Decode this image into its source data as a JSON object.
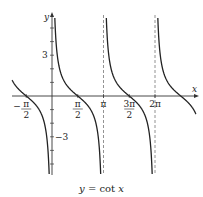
{
  "chart_data": {
    "type": "line",
    "title": "y = cot x",
    "function": "cot(x)",
    "xlabel": "x",
    "ylabel": "y",
    "x_tick_labels": [
      "-π/2",
      "π/2",
      "π",
      "3π/2",
      "2π"
    ],
    "x_tick_values": [
      -1.5708,
      1.5708,
      3.1416,
      4.7124,
      6.2832
    ],
    "y_tick_labels": [
      "3",
      "-3"
    ],
    "y_tick_values": [
      3,
      -3
    ],
    "asymptotes": [
      0,
      3.1416,
      6.2832
    ],
    "xlim": [
      -2.0,
      7.0
    ],
    "ylim": [
      -5.8,
      5.8
    ],
    "grid": false
  },
  "caption": {
    "lhs": "y",
    "eq": " = ",
    "fn": "cot",
    "var": " x"
  },
  "labels": {
    "x": "x",
    "y": "y",
    "y3": "3",
    "ym3": "−3"
  }
}
